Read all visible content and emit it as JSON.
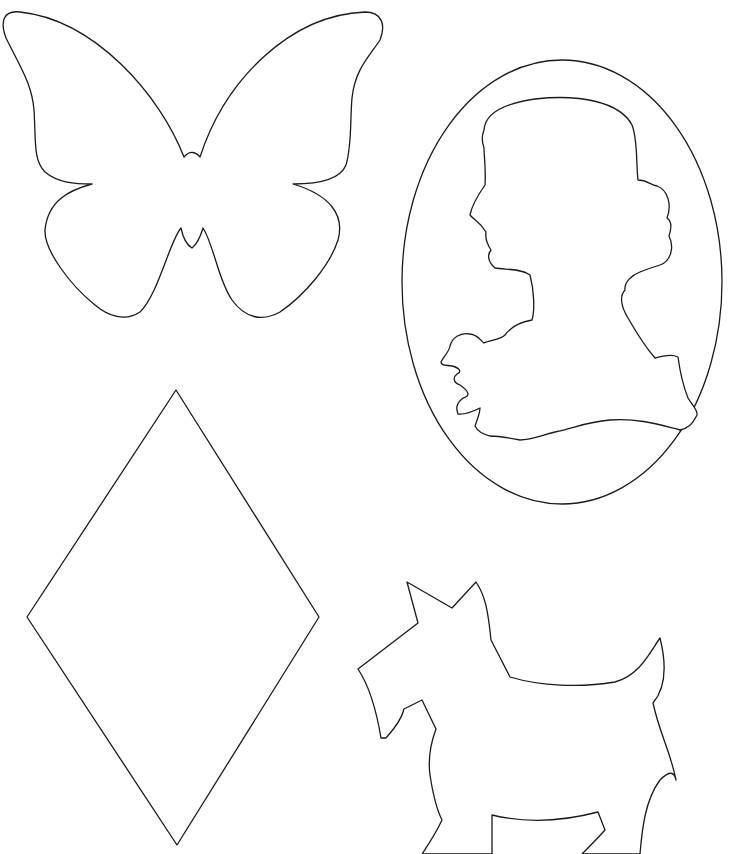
{
  "page": {
    "background": "#ffffff",
    "stroke_color": "#1a1a1a",
    "stroke_width": 1.3
  },
  "shapes": [
    {
      "id": "butterfly",
      "label": "Butterfly outline"
    },
    {
      "id": "cameo",
      "label": "Cameo oval with woman's profile silhouette"
    },
    {
      "id": "diamond",
      "label": "Diamond (rhombus) outline"
    },
    {
      "id": "scottie-dog",
      "label": "Scottie dog outline (cropped at bottom)"
    }
  ]
}
